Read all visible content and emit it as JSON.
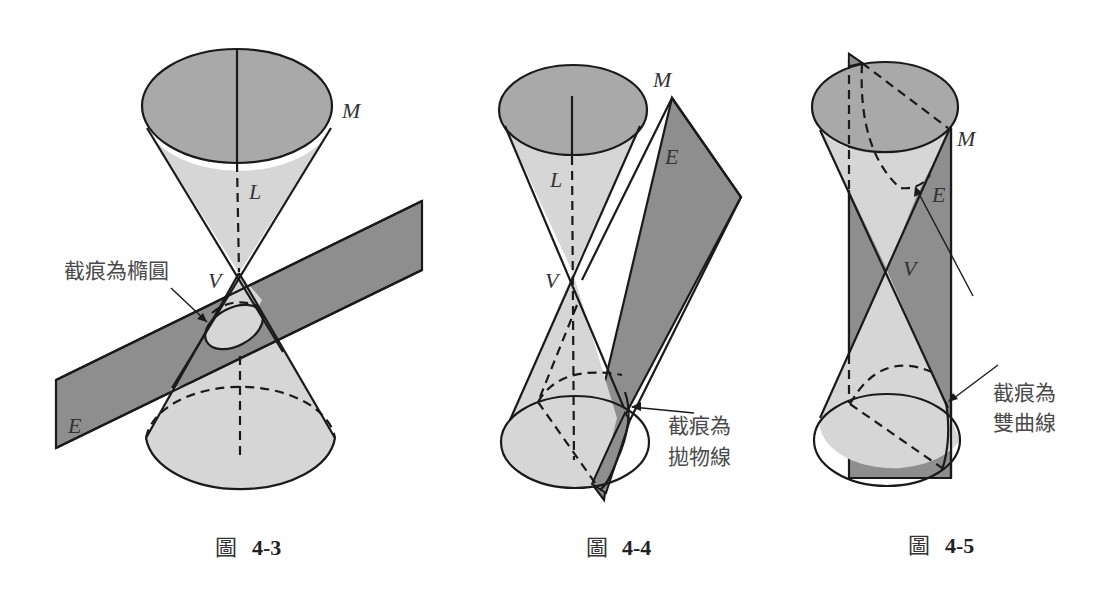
{
  "figures": [
    {
      "id": "fig-4-3",
      "caption_glyph": "圖",
      "caption_number": "4-3",
      "labels": {
        "M": "M",
        "L": "L",
        "V": "V",
        "E": "E"
      },
      "annotation": "截痕為橢圓",
      "section_type": "ellipse"
    },
    {
      "id": "fig-4-4",
      "caption_glyph": "圖",
      "caption_number": "4-4",
      "labels": {
        "M": "M",
        "L": "L",
        "V": "V",
        "E": "E"
      },
      "annotation_line1": "截痕為",
      "annotation_line2": "拋物線",
      "section_type": "parabola"
    },
    {
      "id": "fig-4-5",
      "caption_glyph": "圖",
      "caption_number": "4-5",
      "labels": {
        "M": "M",
        "V": "V",
        "E": "E"
      },
      "annotation_line1": "截痕為",
      "annotation_line2": "雙曲線",
      "section_type": "hyperbola"
    }
  ],
  "colors": {
    "cap": "#a9a9a9",
    "cone": "#d6d6d6",
    "plane": "#8e8e8e",
    "stroke": "#1a1a1a"
  }
}
